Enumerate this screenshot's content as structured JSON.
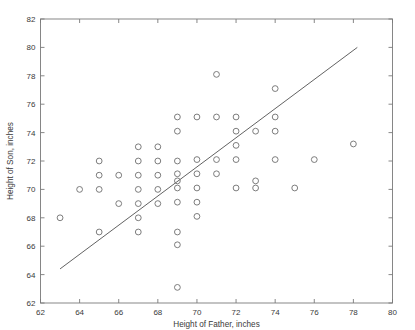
{
  "chart_data": {
    "type": "scatter",
    "title": "",
    "xlabel": "Height of Father, inches",
    "ylabel": "Height of Son, inches",
    "xlim": [
      62,
      80
    ],
    "ylim": [
      62,
      82
    ],
    "xticks": [
      62,
      64,
      66,
      68,
      70,
      72,
      74,
      76,
      78,
      80
    ],
    "yticks": [
      62,
      64,
      66,
      68,
      70,
      72,
      74,
      76,
      78,
      80,
      82
    ],
    "xtick_labels": [
      "62",
      "64",
      "66",
      "68",
      "70",
      "72",
      "74",
      "76",
      "78",
      "80"
    ],
    "ytick_labels": [
      "62",
      "64",
      "66",
      "68",
      "70",
      "72",
      "74",
      "76",
      "78",
      "80",
      "82"
    ],
    "grid": false,
    "legend": "none",
    "marker": "open-circle",
    "marker_color": "#6e6e6e",
    "series": [
      {
        "name": "Father-Son heights",
        "points": [
          [
            63,
            68.0
          ],
          [
            64,
            70.0
          ],
          [
            65,
            72.0
          ],
          [
            65,
            71.0
          ],
          [
            65,
            70.0
          ],
          [
            65,
            67.0
          ],
          [
            66,
            71.0
          ],
          [
            66,
            69.0
          ],
          [
            67,
            73.0
          ],
          [
            67,
            72.0
          ],
          [
            67,
            71.0
          ],
          [
            67,
            70.0
          ],
          [
            67,
            69.0
          ],
          [
            67,
            68.0
          ],
          [
            67,
            67.0
          ],
          [
            68,
            73.0
          ],
          [
            68,
            72.0
          ],
          [
            68,
            71.0
          ],
          [
            68,
            70.0
          ],
          [
            68,
            69.0
          ],
          [
            69,
            75.1
          ],
          [
            69,
            74.1
          ],
          [
            69,
            72.0
          ],
          [
            69,
            71.1
          ],
          [
            69,
            70.6
          ],
          [
            69,
            70.1
          ],
          [
            69,
            69.1
          ],
          [
            69,
            67.0
          ],
          [
            69,
            66.1
          ],
          [
            69,
            63.1
          ],
          [
            70,
            75.1
          ],
          [
            70,
            72.1
          ],
          [
            70,
            71.1
          ],
          [
            70,
            70.1
          ],
          [
            70,
            69.1
          ],
          [
            70,
            68.1
          ],
          [
            71,
            78.1
          ],
          [
            71,
            75.1
          ],
          [
            71,
            72.1
          ],
          [
            71,
            71.1
          ],
          [
            72,
            75.1
          ],
          [
            72,
            74.1
          ],
          [
            72,
            73.1
          ],
          [
            72,
            72.1
          ],
          [
            72,
            70.1
          ],
          [
            73,
            74.1
          ],
          [
            73,
            70.6
          ],
          [
            73,
            70.1
          ],
          [
            74,
            77.1
          ],
          [
            74,
            75.1
          ],
          [
            74,
            74.1
          ],
          [
            74,
            72.1
          ],
          [
            75,
            70.1
          ],
          [
            76,
            72.1
          ],
          [
            78,
            73.2
          ]
        ]
      }
    ],
    "fit_line": {
      "name": "regression-line",
      "x_start": 63.0,
      "y_start": 64.4,
      "x_end": 78.2,
      "y_end": 80.0,
      "color": "#5a5a5a"
    }
  }
}
